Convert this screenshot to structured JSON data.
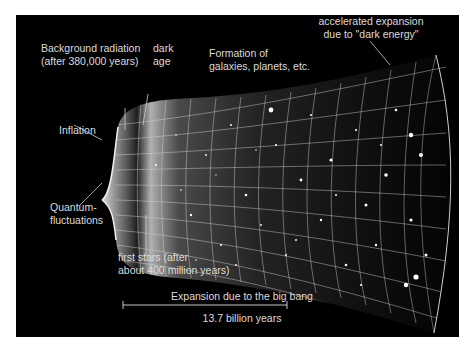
{
  "diagram": {
    "labels": {
      "background_radiation": "Background radiation\n(after 380,000 years)",
      "dark_age": "dark\nage",
      "formation": "Formation of\ngalaxies, planets, etc.",
      "dark_energy": "accelerated expansion\ndue to \"dark energy\"",
      "inflation": "Inflation",
      "quantum": "Quantum-\nfluctuations",
      "first_stars": "first stars (after\nabout 400 million years)",
      "expansion": "Expansion due to the big bang",
      "duration": "13.7 billion years"
    },
    "colors": {
      "background": "#000000",
      "frame": "#ffffff",
      "text": "#dcdcdc",
      "grid": "#d8d8d8"
    }
  }
}
